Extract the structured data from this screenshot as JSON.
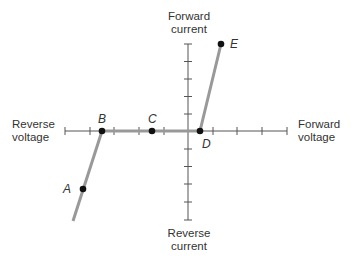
{
  "axes": {
    "top_label_line1": "Forward",
    "top_label_line2": "current",
    "bottom_label_line1": "Reverse",
    "bottom_label_line2": "current",
    "left_label_line1": "Reverse",
    "left_label_line2": "voltage",
    "right_label_line1": "Forward",
    "right_label_line2": "voltage"
  },
  "points": {
    "A": "A",
    "B": "B",
    "C": "C",
    "D": "D",
    "E": "E"
  },
  "colors": {
    "axis": "#555555",
    "curve": "#999999",
    "point": "#111111",
    "text": "#333333"
  }
}
